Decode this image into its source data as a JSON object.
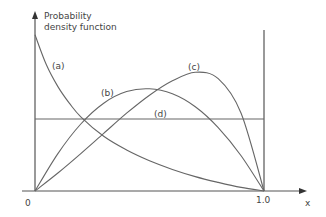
{
  "chart_data": {
    "type": "line",
    "title": "",
    "xlabel": "x",
    "ylabel": "Probability density function",
    "xlim": [
      0,
      1.0
    ],
    "x_ticks": [
      "0",
      "1.0"
    ],
    "grid": false,
    "legend": "inline labels",
    "series": [
      {
        "name": "(a)",
        "x": [
          0,
          0.05,
          0.1,
          0.15,
          0.2,
          0.3,
          0.4,
          0.5,
          0.6,
          0.7,
          0.8,
          0.9,
          1.0
        ],
        "values": [
          2.17,
          1.75,
          1.45,
          1.22,
          1.03,
          0.76,
          0.57,
          0.42,
          0.3,
          0.2,
          0.12,
          0.05,
          0
        ]
      },
      {
        "name": "(b)",
        "x": [
          0,
          0.1,
          0.2,
          0.3,
          0.4,
          0.5,
          0.6,
          0.7,
          0.8,
          0.9,
          1.0
        ],
        "values": [
          0,
          0.52,
          0.93,
          1.22,
          1.38,
          1.42,
          1.35,
          1.17,
          0.88,
          0.49,
          0
        ]
      },
      {
        "name": "(c)",
        "x": [
          0,
          0.1,
          0.2,
          0.3,
          0.4,
          0.5,
          0.6,
          0.7,
          0.8,
          0.9,
          1.0
        ],
        "values": [
          0,
          0.25,
          0.52,
          0.8,
          1.08,
          1.33,
          1.53,
          1.65,
          1.56,
          1.08,
          0
        ]
      },
      {
        "name": "(d)",
        "x": [
          0,
          1.0
        ],
        "values": [
          1.0,
          1.0
        ]
      }
    ]
  },
  "labels": {
    "ylabel_line1": "Probability",
    "ylabel_line2": "density function",
    "xlabel": "x",
    "origin": "0",
    "x_end": "1.0",
    "a": "(a)",
    "b": "(b)",
    "c": "(c)",
    "d": "(d)"
  }
}
